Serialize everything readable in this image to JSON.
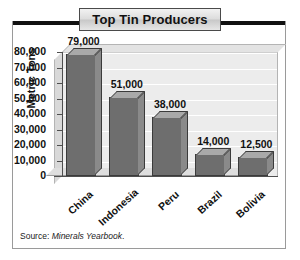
{
  "chart_data": {
    "type": "bar",
    "title": "Top Tin Producers",
    "xlabel": "",
    "ylabel": "Metric Tons",
    "categories": [
      "China",
      "Indonesia",
      "Peru",
      "Brazil",
      "Bolivia"
    ],
    "values": [
      79000,
      51000,
      38000,
      14000,
      12500
    ],
    "value_labels": [
      "79,000",
      "51,000",
      "38,000",
      "14,000",
      "12,500"
    ],
    "ylim": [
      0,
      80000
    ],
    "ytick_labels": [
      "80,000",
      "70,000",
      "60,000",
      "50,000",
      "40,000",
      "30,000",
      "20,000",
      "10,000",
      "0"
    ],
    "ytick_values": [
      80000,
      70000,
      60000,
      50000,
      40000,
      30000,
      20000,
      10000,
      0
    ],
    "grid": true,
    "legend": false,
    "bar_color": "#6e6e6e",
    "plot_background": "#ececec",
    "gridline_color": "#ffffff"
  },
  "source": {
    "prefix": "Source: ",
    "publication": "Minerals Yearbook",
    "suffix": "."
  }
}
